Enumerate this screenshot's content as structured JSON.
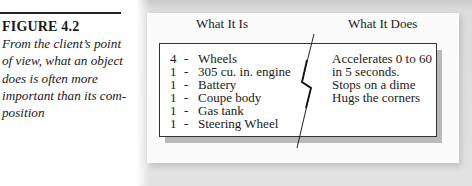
{
  "figure": {
    "label": "FIGURE 4.2",
    "caption_lines": [
      "From the client’s point",
      "of view, what an object",
      "does is often more",
      "important than its com-",
      "position"
    ]
  },
  "diagram": {
    "left_heading": "What It Is",
    "right_heading": "What It Does",
    "components": [
      {
        "qty": "4",
        "sep": "-",
        "name": "Wheels"
      },
      {
        "qty": "1",
        "sep": "-",
        "name": "305 cu. in. engine"
      },
      {
        "qty": "1",
        "sep": "-",
        "name": "Battery"
      },
      {
        "qty": "1",
        "sep": "-",
        "name": "Coupe body"
      },
      {
        "qty": "1",
        "sep": "-",
        "name": "Gas tank"
      },
      {
        "qty": "1",
        "sep": "-",
        "name": "Steering Wheel"
      }
    ],
    "behaviors": [
      "Accelerates 0 to 60",
      "in 5 seconds.",
      "Stops on a dime",
      "Hugs the corners"
    ],
    "divider_icon": "lightning-bolt-divider"
  }
}
